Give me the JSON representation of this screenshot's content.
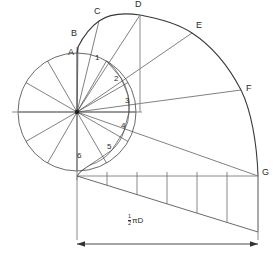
{
  "figure": {
    "type": "geometric-construction",
    "name": "archimedean-spiral-construction"
  },
  "points": [
    {
      "id": "A",
      "label": "A",
      "x": 68,
      "y": 52,
      "node_x": 77,
      "node_y": 53
    },
    {
      "id": "B",
      "label": "B",
      "x": 71,
      "y": 34,
      "node_x": 78,
      "node_y": 47
    },
    {
      "id": "C",
      "label": "C",
      "x": 94,
      "y": 12,
      "node_x": 99,
      "node_y": 21
    },
    {
      "id": "D",
      "label": "D",
      "x": 135,
      "y": 4,
      "node_x": 140,
      "node_y": 15
    },
    {
      "id": "E",
      "label": "E",
      "x": 196,
      "y": 25,
      "node_x": 192,
      "node_y": 33
    },
    {
      "id": "F",
      "label": "F",
      "x": 246,
      "y": 88,
      "node_x": 241,
      "node_y": 90
    },
    {
      "id": "G",
      "label": "G",
      "x": 262,
      "y": 171,
      "node_x": 258,
      "node_y": 176
    }
  ],
  "divisions": [
    {
      "id": "1",
      "label": "1",
      "x": 95,
      "y": 57
    },
    {
      "id": "2",
      "label": "2",
      "x": 114,
      "y": 78
    },
    {
      "id": "3",
      "label": "3",
      "x": 125,
      "y": 100
    },
    {
      "id": "4",
      "label": "4",
      "x": 121,
      "y": 125
    },
    {
      "id": "5",
      "label": "5",
      "x": 107,
      "y": 146
    },
    {
      "id": "6",
      "label": "6",
      "x": 77,
      "y": 155
    }
  ],
  "dimension": {
    "numerator": "1",
    "denominator": "2",
    "symbol": "πD",
    "full_label": "1/2 πD",
    "x": 128,
    "y": 216
  },
  "colors": {
    "line": "#333333",
    "construction": "#555555",
    "axis": "#777777",
    "background": "#ffffff",
    "text": "#2b2b2b"
  },
  "geometry": {
    "center": {
      "x": 77,
      "y": 112
    },
    "base_radius": 59,
    "sectors": 12,
    "baseline_y": 176,
    "dimension_line_y": 244,
    "dim_start_x": 77,
    "dim_end_x": 258
  }
}
